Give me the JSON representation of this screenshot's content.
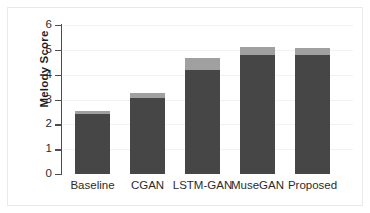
{
  "chart_data": {
    "type": "bar",
    "title": "",
    "subtitle": "",
    "xlabel": "",
    "ylabel": "Melody Score",
    "categories": [
      "Baseline",
      "CGAN",
      "LSTM-GAN",
      "MuseGAN",
      "Proposed"
    ],
    "values": [
      2.54,
      3.27,
      4.68,
      5.12,
      5.08
    ],
    "series": [
      {
        "name": "score",
        "values": [
          2.4,
          3.07,
          4.2,
          4.8,
          4.8
        ]
      },
      {
        "name": "error-cap",
        "values": [
          0.14,
          0.2,
          0.48,
          0.32,
          0.28
        ]
      }
    ],
    "ylim": [
      0,
      6
    ],
    "ytick_labels": [
      "0",
      "1",
      "2",
      "3",
      "4",
      "5",
      "6"
    ],
    "ytick_values": [
      0,
      1,
      2,
      3,
      4,
      5,
      6
    ],
    "grid": true,
    "grid_axis": "y",
    "legend": false,
    "legend_position": "none",
    "bar_color_lower": "#464646",
    "bar_color_upper": "#a0a0a0",
    "axis_color": "#4d4d4d",
    "grid_color": "#f2f2f2",
    "background_color": "#ffffff",
    "annotations": []
  },
  "axis": {
    "ylabel": "Melody Score",
    "yticks": [
      {
        "label": "6",
        "value": 6
      },
      {
        "label": "5",
        "value": 5
      },
      {
        "label": "4",
        "value": 4
      },
      {
        "label": "3",
        "value": 3
      },
      {
        "label": "2",
        "value": 2
      },
      {
        "label": "1",
        "value": 1
      },
      {
        "label": "0",
        "value": 0
      }
    ]
  },
  "bars": [
    {
      "label": "Baseline",
      "total": 2.54,
      "lower": 2.4,
      "upper": 0.14
    },
    {
      "label": "CGAN",
      "total": 3.27,
      "lower": 3.07,
      "upper": 0.2
    },
    {
      "label": "LSTM-GAN",
      "total": 4.68,
      "lower": 4.2,
      "upper": 0.48
    },
    {
      "label": "MuseGAN",
      "total": 5.12,
      "lower": 4.8,
      "upper": 0.32
    },
    {
      "label": "Proposed",
      "total": 5.08,
      "lower": 4.8,
      "upper": 0.28
    }
  ]
}
